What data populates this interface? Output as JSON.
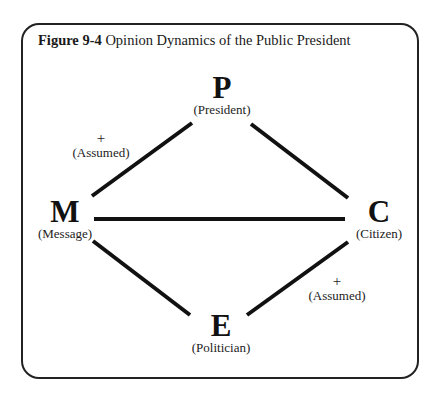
{
  "figure": {
    "label": "Figure 9-4",
    "title": "Opinion Dynamics of the Public President"
  },
  "nodes": {
    "P": {
      "letter": "P",
      "name": "(President)"
    },
    "M": {
      "letter": "M",
      "name": "(Message)"
    },
    "C": {
      "letter": "C",
      "name": "(Citizen)"
    },
    "E": {
      "letter": "E",
      "name": "(Politician)"
    }
  },
  "edges": [
    {
      "from": "P",
      "to": "M",
      "sign": "+",
      "note": "(Assumed)"
    },
    {
      "from": "P",
      "to": "C",
      "sign": "",
      "note": ""
    },
    {
      "from": "M",
      "to": "C",
      "sign": "",
      "note": ""
    },
    {
      "from": "M",
      "to": "E",
      "sign": "",
      "note": ""
    },
    {
      "from": "E",
      "to": "C",
      "sign": "+",
      "note": "(Assumed)"
    }
  ],
  "colors": {
    "line": "#111111",
    "frame": "#222222",
    "background": "#ffffff"
  }
}
